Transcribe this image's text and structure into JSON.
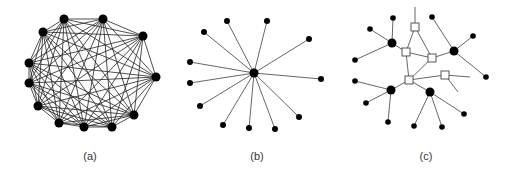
{
  "figure": {
    "panels": [
      {
        "id": "a",
        "label": "(a)",
        "label_pos": [
          90,
          150
        ],
        "type": "complete-graph",
        "node_radius": 4.5,
        "edge_color": "#222222",
        "edge_width": 0.8,
        "nodes": [
          [
            64,
            19
          ],
          [
            103,
            19
          ],
          [
            143,
            36
          ],
          [
            156,
            77
          ],
          [
            134,
            115
          ],
          [
            112,
            127
          ],
          [
            84,
            127
          ],
          [
            59,
            123
          ],
          [
            38,
            106
          ],
          [
            29,
            83
          ],
          [
            29,
            63
          ],
          [
            43,
            32
          ]
        ]
      },
      {
        "id": "b",
        "label": "(b)",
        "label_pos": [
          257,
          150
        ],
        "type": "star-graph",
        "center": [
          254,
          73
        ],
        "center_radius": 4.5,
        "leaf_radius": 3,
        "edge_color": "#555555",
        "edge_width": 0.9,
        "leaves": [
          [
            227,
            21
          ],
          [
            267,
            21
          ],
          [
            309,
            39
          ],
          [
            321,
            79
          ],
          [
            299,
            117
          ],
          [
            275,
            129
          ],
          [
            249,
            128
          ],
          [
            223,
            125
          ],
          [
            200,
            106
          ],
          [
            190,
            83
          ],
          [
            190,
            62
          ],
          [
            204,
            32
          ]
        ]
      },
      {
        "id": "c",
        "label": "(c)",
        "label_pos": [
          426,
          150
        ],
        "type": "hybrid-graph",
        "edge_color": "#555555",
        "edge_width": 0.9,
        "square_size": 8,
        "hub_radius": 4.5,
        "leaf_radius": 2.8,
        "squares": [
          [
            415,
            27
          ],
          [
            406,
            52
          ],
          [
            432,
            58
          ],
          [
            445,
            75
          ],
          [
            409,
            80
          ]
        ],
        "hubs": [
          [
            392,
            43
          ],
          [
            454,
            51
          ],
          [
            391,
            90
          ],
          [
            430,
            92
          ]
        ],
        "leaves": [
          [
            393,
            18
          ],
          [
            370,
            29
          ],
          [
            355,
            60
          ],
          [
            432,
            17
          ],
          [
            473,
            36
          ],
          [
            486,
            77
          ],
          [
            355,
            81
          ],
          [
            366,
            103
          ],
          [
            388,
            122
          ],
          [
            414,
            126
          ],
          [
            442,
            127
          ],
          [
            464,
            114
          ]
        ],
        "edges": [
          [
            [
              415,
              27
            ],
            [
              415,
              7
            ]
          ],
          [
            [
              415,
              27
            ],
            [
              406,
              52
            ]
          ],
          [
            [
              415,
              27
            ],
            [
              432,
              58
            ]
          ],
          [
            [
              406,
              52
            ],
            [
              432,
              58
            ]
          ],
          [
            [
              406,
              52
            ],
            [
              409,
              80
            ]
          ],
          [
            [
              432,
              58
            ],
            [
              409,
              80
            ]
          ],
          [
            [
              432,
              58
            ],
            [
              454,
              51
            ]
          ],
          [
            [
              409,
              80
            ],
            [
              445,
              75
            ]
          ],
          [
            [
              445,
              75
            ],
            [
              470,
              77
            ]
          ],
          [
            [
              445,
              75
            ],
            [
              458,
              92
            ]
          ],
          [
            [
              392,
              43
            ],
            [
              406,
              52
            ]
          ],
          [
            [
              392,
              43
            ],
            [
              393,
              18
            ]
          ],
          [
            [
              392,
              43
            ],
            [
              370,
              29
            ]
          ],
          [
            [
              392,
              43
            ],
            [
              355,
              60
            ]
          ],
          [
            [
              454,
              51
            ],
            [
              432,
              17
            ]
          ],
          [
            [
              454,
              51
            ],
            [
              473,
              36
            ]
          ],
          [
            [
              454,
              51
            ],
            [
              486,
              77
            ]
          ],
          [
            [
              391,
              90
            ],
            [
              409,
              80
            ]
          ],
          [
            [
              391,
              90
            ],
            [
              355,
              81
            ]
          ],
          [
            [
              391,
              90
            ],
            [
              366,
              103
            ]
          ],
          [
            [
              391,
              90
            ],
            [
              388,
              122
            ]
          ],
          [
            [
              430,
              92
            ],
            [
              409,
              80
            ]
          ],
          [
            [
              430,
              92
            ],
            [
              414,
              126
            ]
          ],
          [
            [
              430,
              92
            ],
            [
              442,
              127
            ]
          ],
          [
            [
              430,
              92
            ],
            [
              464,
              114
            ]
          ]
        ]
      }
    ]
  }
}
